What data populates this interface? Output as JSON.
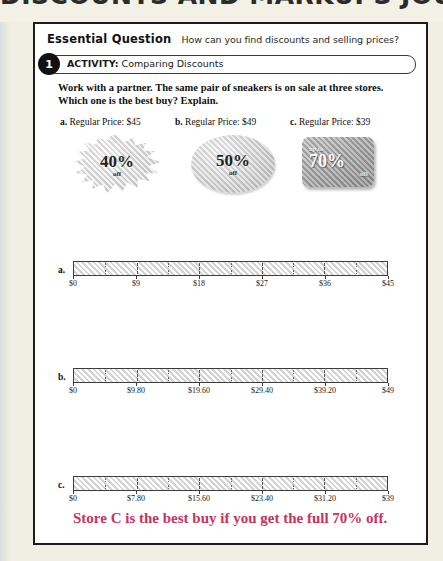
{
  "scan": {
    "clipped_title": "DISCOUNTS AND MARKUPS JOURNAL",
    "page_bg": "#ffffff",
    "surround_bg": "#f1efe3",
    "frame_color": "#1d1d1d"
  },
  "essential_question": {
    "label": "Essential Question",
    "text": "How can you find discounts and selling prices?"
  },
  "activity": {
    "number": "1",
    "kicker": "ACTIVITY:",
    "title": "Comparing Discounts"
  },
  "instructions": {
    "line1": "Work with a partner. The same pair of sneakers is on sale at three stores.",
    "line2": "Which one is the best buy? Explain."
  },
  "stores": [
    {
      "letter": "a.",
      "heading": "Regular Price: $45",
      "badge_shape": "starburst",
      "badge_upto": "",
      "badge_percent": "40%",
      "badge_off": "off"
    },
    {
      "letter": "b.",
      "heading": "Regular Price: $49",
      "badge_shape": "oval",
      "badge_upto": "",
      "badge_percent": "50%",
      "badge_off": "off"
    },
    {
      "letter": "c.",
      "heading": "Regular Price: $39",
      "badge_shape": "rounded-rect",
      "badge_upto": "up to",
      "badge_percent": "70%",
      "badge_off": "off"
    }
  ],
  "number_lines": [
    {
      "letter": "a.",
      "labels": [
        "$0",
        "$9",
        "$18",
        "$27",
        "$36",
        "$45"
      ],
      "max": 45
    },
    {
      "letter": "b.",
      "labels": [
        "$0",
        "$9.80",
        "$19.60",
        "$29.40",
        "$39.20",
        "$49"
      ],
      "max": 49
    },
    {
      "letter": "c.",
      "labels": [
        "$0",
        "$7.80",
        "$15.60",
        "$23.40",
        "$31.20",
        "$39"
      ],
      "max": 39
    }
  ],
  "answer": {
    "text": "Store C is the best buy if you get the full 70% off.",
    "color": "#c8325c"
  }
}
